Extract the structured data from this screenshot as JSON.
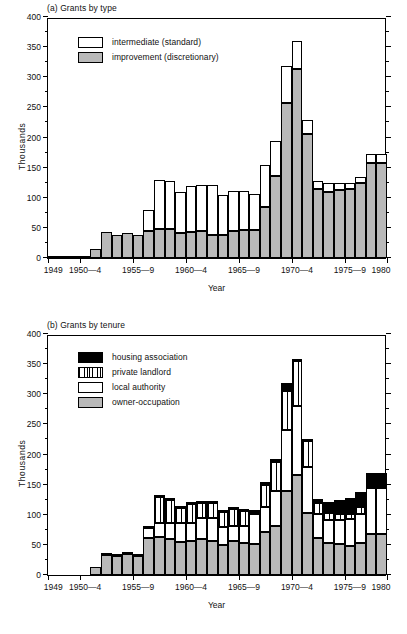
{
  "figure": {
    "y_axis_title": "Thousands",
    "x_axis_title": "Year"
  },
  "panels": [
    {
      "id": "a",
      "title": "(a) Grants by type",
      "legend": [
        {
          "key": "intermediate",
          "label": "intermediate (standard)",
          "fill": "white"
        },
        {
          "key": "improvement",
          "label": "improvement (discretionary)",
          "fill": "grey"
        }
      ]
    },
    {
      "id": "b",
      "title": "(b) Grants by tenure",
      "legend": [
        {
          "key": "housing_association",
          "label": "housing association",
          "fill": "black"
        },
        {
          "key": "private_landlord",
          "label": "private landlord",
          "fill": "stripe"
        },
        {
          "key": "local_authority",
          "label": "local authority",
          "fill": "white"
        },
        {
          "key": "owner_occupation",
          "label": "owner-occupation",
          "fill": "grey"
        }
      ]
    }
  ],
  "chart_data": [
    {
      "type": "bar",
      "stacked": true,
      "panel": "a",
      "title": "(a) Grants by type",
      "xlabel": "Year",
      "ylabel": "Thousands",
      "ylim": [
        0,
        400
      ],
      "ytick_major": [
        0,
        50,
        100,
        150,
        200,
        250,
        300,
        350,
        400
      ],
      "ytick_minor_step": 25,
      "grid": false,
      "legend_position": "top-left inside",
      "x_tick_labels": [
        "1949",
        "1950—4",
        "1955—9",
        "1960—4",
        "1965—9",
        "1970—4",
        "1975—9",
        "1980"
      ],
      "x_tick_years": [
        1949,
        1952,
        1957,
        1962,
        1967,
        1972,
        1977,
        1980
      ],
      "categories": [
        1949,
        1950,
        1951,
        1952,
        1953,
        1954,
        1955,
        1956,
        1957,
        1958,
        1959,
        1960,
        1961,
        1962,
        1963,
        1964,
        1965,
        1966,
        1967,
        1968,
        1969,
        1970,
        1971,
        1972,
        1973,
        1974,
        1975,
        1976,
        1977,
        1978,
        1979,
        1980
      ],
      "series": [
        {
          "name": "improvement (discretionary)",
          "fill": "grey",
          "values": [
            1,
            1,
            1,
            1,
            15,
            43,
            39,
            42,
            39,
            45,
            48,
            48,
            41,
            43,
            45,
            39,
            39,
            45,
            46,
            47,
            85,
            136,
            258,
            313,
            206,
            115,
            110,
            113,
            115,
            125,
            157,
            157
          ]
        },
        {
          "name": "intermediate (standard)",
          "fill": "white",
          "values": [
            0,
            0,
            0,
            0,
            0,
            0,
            0,
            0,
            0,
            34,
            82,
            80,
            69,
            76,
            76,
            83,
            66,
            66,
            66,
            60,
            70,
            59,
            60,
            47,
            23,
            13,
            14,
            12,
            10,
            9,
            16,
            16
          ]
        }
      ],
      "totals": [
        1,
        1,
        1,
        1,
        15,
        43,
        39,
        42,
        39,
        79,
        130,
        128,
        110,
        119,
        121,
        122,
        105,
        111,
        112,
        107,
        155,
        195,
        318,
        360,
        229,
        128,
        124,
        125,
        125,
        134,
        173,
        173
      ]
    },
    {
      "type": "bar",
      "stacked": true,
      "panel": "b",
      "title": "(b) Grants by tenure",
      "xlabel": "Year",
      "ylabel": "Thousands",
      "ylim": [
        0,
        400
      ],
      "ytick_major": [
        0,
        50,
        100,
        150,
        200,
        250,
        300,
        350,
        400
      ],
      "ytick_minor_step": 25,
      "grid": false,
      "legend_position": "top-left inside",
      "x_tick_labels": [
        "1949",
        "1950—4",
        "1955—9",
        "1960—4",
        "1965—9",
        "1970—4",
        "1975—9",
        "1980"
      ],
      "x_tick_years": [
        1949,
        1952,
        1957,
        1962,
        1967,
        1972,
        1977,
        1980
      ],
      "categories": [
        1949,
        1950,
        1951,
        1952,
        1953,
        1954,
        1955,
        1956,
        1957,
        1958,
        1959,
        1960,
        1961,
        1962,
        1963,
        1964,
        1965,
        1966,
        1967,
        1968,
        1969,
        1970,
        1971,
        1972,
        1973,
        1974,
        1975,
        1976,
        1977,
        1978,
        1979,
        1980
      ],
      "series": [
        {
          "name": "owner-occupation",
          "fill": "grey",
          "values": [
            0,
            0,
            0,
            0,
            14,
            34,
            32,
            35,
            32,
            61,
            63,
            59,
            54,
            57,
            59,
            56,
            50,
            56,
            53,
            52,
            71,
            81,
            139,
            166,
            103,
            62,
            53,
            52,
            48,
            53,
            68,
            68
          ]
        },
        {
          "name": "local authority",
          "fill": "white",
          "values": [
            0,
            0,
            0,
            0,
            0,
            2,
            2,
            2,
            2,
            17,
            23,
            27,
            32,
            30,
            36,
            39,
            29,
            26,
            28,
            49,
            42,
            59,
            101,
            114,
            77,
            39,
            38,
            40,
            45,
            49,
            76,
            76
          ]
        },
        {
          "name": "private landlord",
          "fill": "stripe",
          "values": [
            0,
            0,
            0,
            0,
            0,
            0,
            0,
            0,
            0,
            1,
            44,
            39,
            25,
            31,
            24,
            25,
            26,
            27,
            25,
            4,
            36,
            47,
            66,
            76,
            42,
            19,
            12,
            9,
            9,
            11,
            2,
            2
          ]
        },
        {
          "name": "housing association",
          "fill": "black",
          "values": [
            0,
            0,
            0,
            0,
            0,
            0,
            0,
            0,
            0,
            0,
            1,
            1,
            1,
            1,
            1,
            1,
            1,
            1,
            1,
            1,
            5,
            6,
            12,
            2,
            4,
            6,
            19,
            23,
            25,
            24,
            23,
            23
          ]
        }
      ],
      "totals": [
        0,
        0,
        0,
        0,
        14,
        36,
        34,
        37,
        34,
        79,
        131,
        126,
        112,
        119,
        120,
        121,
        106,
        110,
        107,
        106,
        154,
        193,
        318,
        358,
        226,
        126,
        122,
        124,
        127,
        137,
        169,
        169
      ]
    }
  ]
}
